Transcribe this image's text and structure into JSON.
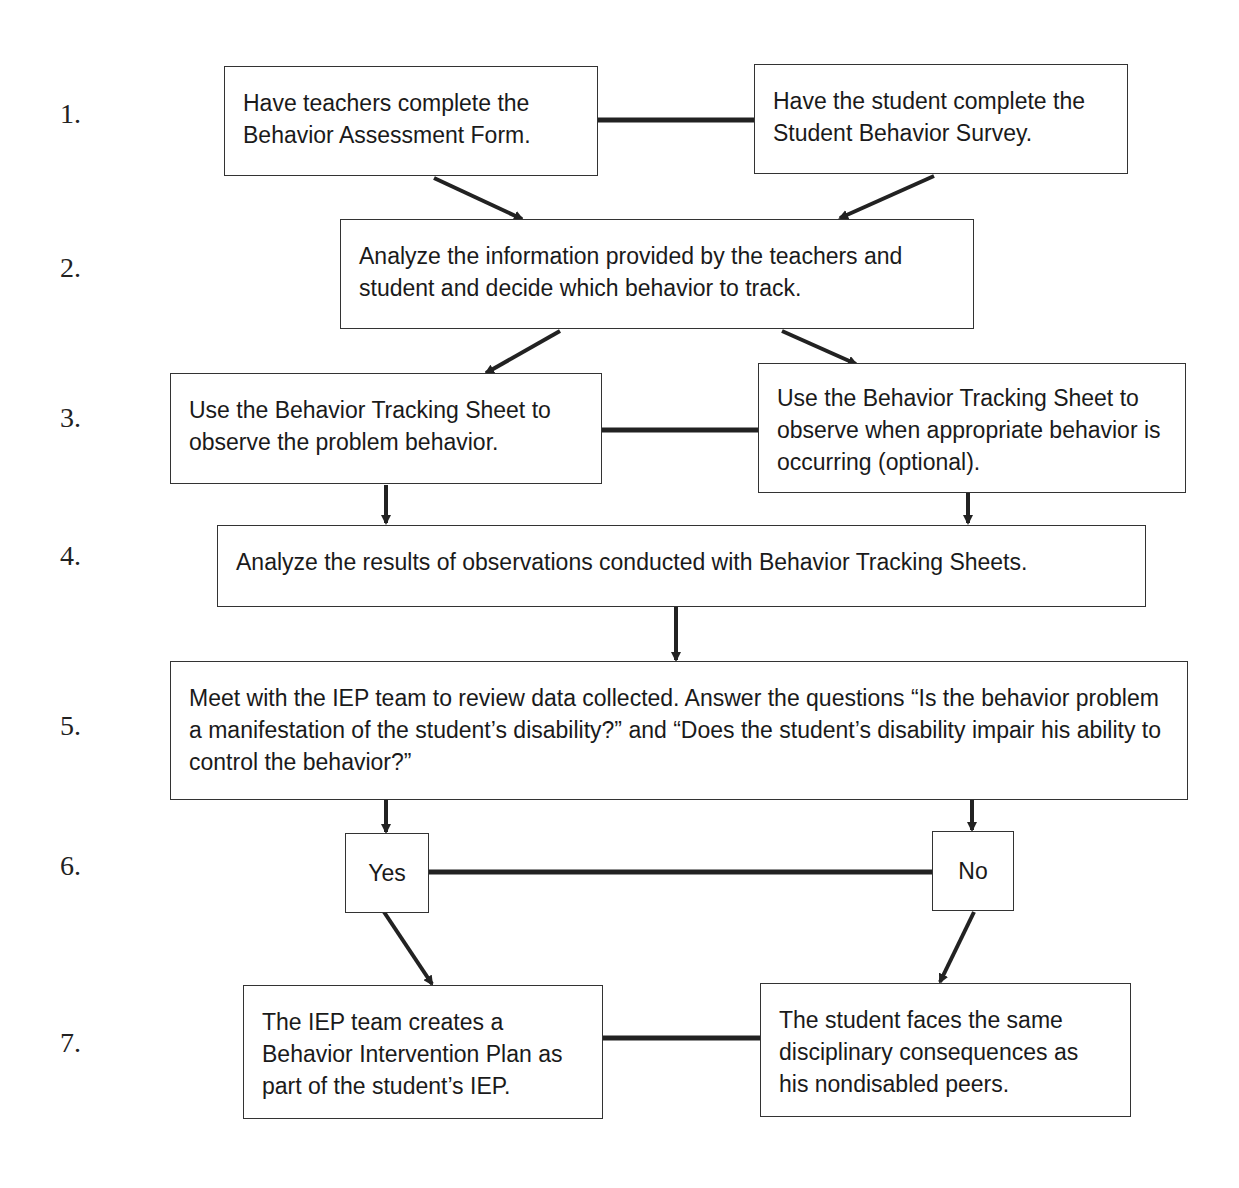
{
  "steps": [
    "1.",
    "2.",
    "3.",
    "4.",
    "5.",
    "6.",
    "7."
  ],
  "nodes": {
    "teachers_form": "Have teachers complete the Behavior Assessment Form.",
    "student_survey": "Have the student complete the Student Behavior Survey.",
    "analyze_info": "Analyze the information provided by the teachers and student and decide which behavior to track.",
    "track_problem": "Use the Behavior Tracking Sheet to observe the problem behavior.",
    "track_appropriate": "Use the Behavior Tracking Sheet to observe when appropriate behavior is occurring (optional).",
    "analyze_results": "Analyze the results of observations conducted with Behavior Tracking Sheets.",
    "iep_meeting": "Meet with the IEP team to review data collected.  Answer the questions “Is the behavior problem a manifestation of the student’s disability?” and “Does the student’s disability impair his ability to control the behavior?”",
    "yes": "Yes",
    "no": "No",
    "bip": "The IEP team creates a Behavior Intervention Plan as part of the student’s IEP.",
    "same_consequences": "The student faces the same disciplinary consequences as his nondisabled peers."
  }
}
